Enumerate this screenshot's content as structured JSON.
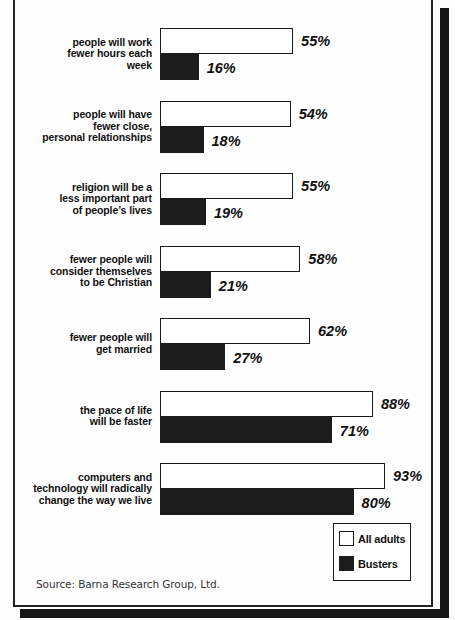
{
  "chart_data": {
    "type": "bar",
    "orientation": "horizontal",
    "title": "",
    "subtitle": "",
    "xlabel": "",
    "ylabel": "",
    "xlim": [
      0,
      100
    ],
    "grid": false,
    "value_suffix": "%",
    "legend_position": "bottom-right",
    "categories": [
      "people will work fewer hours each week",
      "people will have fewer close, personal relationships",
      "religion will be a less important part of people’s lives",
      "fewer people will consider themselves to be Christian",
      "fewer people will get married",
      "the pace of life will be faster",
      "computers and technology will radically change the way we live"
    ],
    "category_lines": [
      [
        "people will work",
        "fewer hours each",
        "week"
      ],
      [
        "people will have",
        "fewer close,",
        "personal relationships"
      ],
      [
        "religion will be a",
        "less important part",
        "of people’s lives"
      ],
      [
        "fewer people will",
        "consider themselves",
        "to be Christian"
      ],
      [
        "fewer people will",
        "get married"
      ],
      [
        "the pace of life",
        "will be faster"
      ],
      [
        "computers and",
        "technology will radically",
        "change the way we live"
      ]
    ],
    "series": [
      {
        "name": "All adults",
        "color": "#ffffff",
        "values": [
          55,
          54,
          55,
          58,
          62,
          88,
          93
        ],
        "labels": [
          "55%",
          "54%",
          "55%",
          "58%",
          "62%",
          "88%",
          "93%"
        ]
      },
      {
        "name": "Busters",
        "color": "#1c1c1c",
        "values": [
          16,
          18,
          19,
          21,
          27,
          71,
          80
        ],
        "labels": [
          "16%",
          "18%",
          "19%",
          "21%",
          "27%",
          "71%",
          "80%"
        ]
      }
    ]
  },
  "legend": {
    "items": [
      {
        "label": "All adults",
        "swatch": "white-square-outline"
      },
      {
        "label": "Busters",
        "swatch": "black-square-filled"
      }
    ]
  },
  "source": {
    "text": "Source: Barna Research Group, Ltd."
  }
}
